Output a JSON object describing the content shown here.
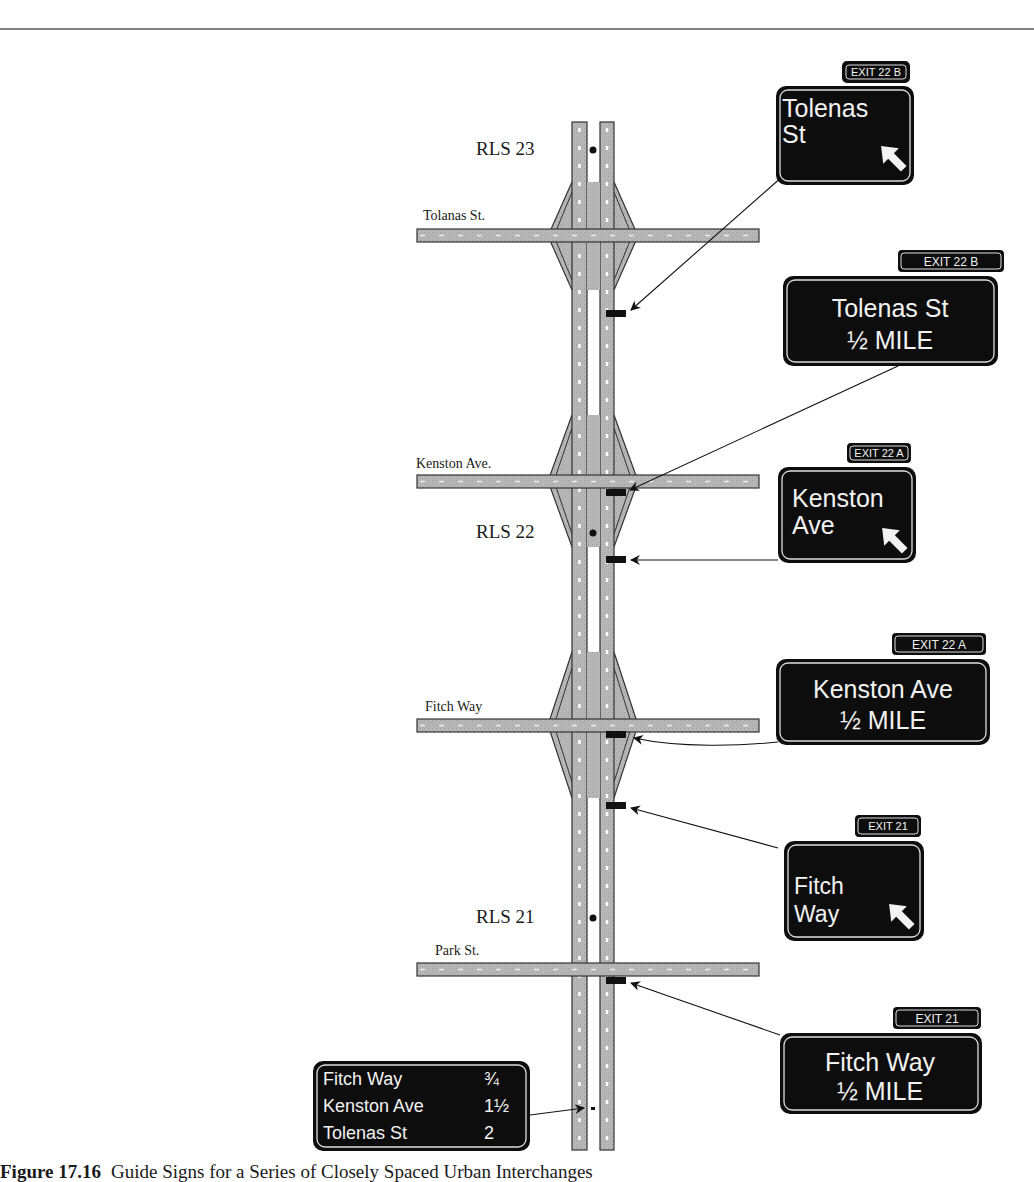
{
  "figure": {
    "number": "Figure 17.16",
    "caption": "Guide Signs for a Series of Closely Spaced Urban Interchanges"
  },
  "reference_locations": [
    {
      "label": "RLS 23"
    },
    {
      "label": "RLS 22"
    },
    {
      "label": "RLS 21"
    }
  ],
  "cross_streets": [
    {
      "label": "Tolanas St.",
      "has_interchange": true
    },
    {
      "label": "Kenston Ave.",
      "has_interchange": true
    },
    {
      "label": "Fitch Way",
      "has_interchange": true
    },
    {
      "label": "Park St.",
      "has_interchange": false
    }
  ],
  "signs": [
    {
      "type": "exit-direction",
      "tab": "EXIT 22 B",
      "lines": [
        "Tolenas",
        "St"
      ],
      "arrow": "up-right-arrow"
    },
    {
      "type": "advance-guide",
      "tab": "EXIT 22 B",
      "lines": [
        "Tolenas St",
        "½ MILE"
      ]
    },
    {
      "type": "exit-direction",
      "tab": "EXIT 22 A",
      "lines": [
        "Kenston",
        "Ave"
      ],
      "arrow": "up-right-arrow"
    },
    {
      "type": "advance-guide",
      "tab": "EXIT 22 A",
      "lines": [
        "Kenston Ave",
        "½  MILE"
      ]
    },
    {
      "type": "exit-direction",
      "tab": "EXIT 21",
      "lines": [
        "Fitch",
        "Way"
      ],
      "arrow": "up-right-arrow"
    },
    {
      "type": "advance-guide",
      "tab": "EXIT 21",
      "lines": [
        "Fitch Way",
        "½ MILE"
      ]
    }
  ],
  "distance_sign": {
    "rows": [
      {
        "destination": "Fitch Way",
        "distance": "¾"
      },
      {
        "destination": "Kenston Ave",
        "distance": "1½"
      },
      {
        "destination": "Tolenas St",
        "distance": "2"
      }
    ]
  },
  "colors": {
    "road_fill": "#b4b4b4",
    "road_edge": "#3a3a3a",
    "sign_bg": "#0d0d0d",
    "sign_text": "#f2f2f2",
    "lane_marking": "#ffffff"
  }
}
